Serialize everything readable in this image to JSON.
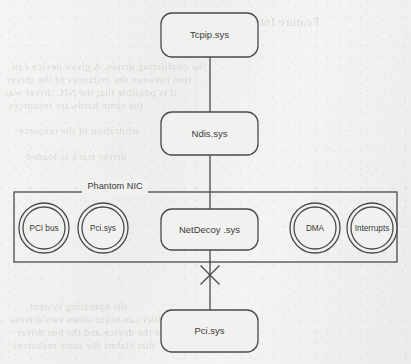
{
  "figure": {
    "type": "block-diagram",
    "background": "#f1f1ef",
    "ink_color": "#4a4a4a",
    "text_color": "#3a3a3a"
  },
  "nodes": {
    "tcpip": {
      "label": "Tcpip.sys",
      "shape": "rounded-rect",
      "x": 161,
      "y": 13,
      "w": 97,
      "h": 44
    },
    "ndis": {
      "label": "Ndis.sys",
      "shape": "rounded-rect",
      "x": 161,
      "y": 112,
      "w": 97,
      "h": 43
    },
    "netdecoy": {
      "label": "NetDecoy .sys",
      "shape": "rounded-rect",
      "x": 161,
      "y": 209,
      "w": 97,
      "h": 41
    },
    "pci_bottom": {
      "label": "Pci.sys",
      "shape": "rounded-rect",
      "x": 161,
      "y": 310,
      "w": 97,
      "h": 42
    }
  },
  "group": {
    "label": "Phantom NIC",
    "x": 14,
    "y": 192,
    "w": 383,
    "h": 70,
    "label_x": 115,
    "label_y": 187
  },
  "circles": [
    {
      "label": "PCI bus",
      "cx": 44,
      "cy": 228,
      "r_outer": 25,
      "r_inner": 21
    },
    {
      "label": "Pci.sys",
      "cx": 103,
      "cy": 228,
      "r_outer": 25,
      "r_inner": 21
    },
    {
      "label": "DMA",
      "cx": 315,
      "cy": 228,
      "r_outer": 25,
      "r_inner": 21
    },
    {
      "label": "Interrupts",
      "cx": 372,
      "cy": 228,
      "r_outer": 25,
      "r_inner": 21
    }
  ],
  "connectors": [
    {
      "name": "tcpip-to-ndis",
      "x1": 210,
      "y1": 57,
      "x2": 210,
      "y2": 112,
      "crossed": false
    },
    {
      "name": "ndis-to-netdecoy",
      "x1": 210,
      "y1": 155,
      "x2": 210,
      "y2": 209,
      "crossed": false
    },
    {
      "name": "netdecoy-to-pci",
      "x1": 210,
      "y1": 250,
      "x2": 210,
      "y2": 310,
      "crossed": true
    }
  ],
  "cross_marker": {
    "name": "severed-link-x",
    "cx": 210,
    "cy": 275,
    "size": 19
  },
  "bleed_through": [
    {
      "text": "Feature Interactions",
      "x": 210,
      "y": 14,
      "size": 13
    },
    {
      "text": "the conflicting driver. A given device can",
      "x": 12,
      "y": 60,
      "size": 11
    },
    {
      "text": "tion between the instances of the driver",
      "x": 6,
      "y": 73,
      "size": 11
    },
    {
      "text": "it is possible that the NIC driver was",
      "x": 4,
      "y": 86,
      "size": 11
    },
    {
      "text": "the same hardware resources",
      "x": 8,
      "y": 99,
      "size": 11
    },
    {
      "text": "arbitration of the resource",
      "x": 18,
      "y": 124,
      "size": 11
    },
    {
      "text": "driver stack is loaded",
      "x": 26,
      "y": 150,
      "size": 11
    },
    {
      "text": "the operating system",
      "x": 30,
      "y": 300,
      "size": 11
    },
    {
      "text": "a conflict can occur when two drivers",
      "x": 10,
      "y": 313,
      "size": 11
    },
    {
      "text": "of the device and the bus driver",
      "x": 16,
      "y": 326,
      "size": 11
    },
    {
      "text": "that claims the same resources",
      "x": 12,
      "y": 339,
      "size": 11
    }
  ]
}
